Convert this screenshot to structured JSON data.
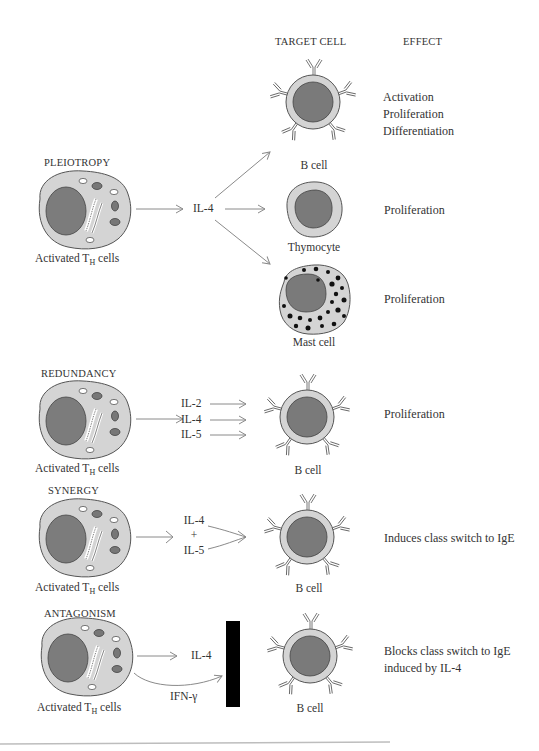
{
  "headers": {
    "target_cell": "TARGET CELL",
    "effect": "EFFECT"
  },
  "colors": {
    "cytoplasm": "#d2d2d2",
    "nucleus": "#7a7a7a",
    "outline": "#555555",
    "arrow": "#8a8a8a",
    "block_bar": "#000000"
  },
  "sections": {
    "pleiotropy": {
      "title": "PLEIOTROPY",
      "source_label": "Activated T",
      "source_sub": "H",
      "source_suffix": " cells",
      "cytokine": "IL-4",
      "targets": [
        {
          "cell": "B cell",
          "effect_lines": [
            "Activation",
            "Proliferation",
            "Differentiation"
          ]
        },
        {
          "cell": "Thymocyte",
          "effect_lines": [
            "Proliferation"
          ]
        },
        {
          "cell": "Mast cell",
          "effect_lines": [
            "Proliferation"
          ]
        }
      ]
    },
    "redundancy": {
      "title": "REDUNDANCY",
      "source_label": "Activated T",
      "source_sub": "H",
      "source_suffix": " cells",
      "cytokines": [
        "IL-2",
        "IL-4",
        "IL-5"
      ],
      "target_cell": "B cell",
      "effect": "Proliferation"
    },
    "synergy": {
      "title": "SYNERGY",
      "source_label": "Activated T",
      "source_sub": "H",
      "source_suffix": " cells",
      "cytokine_1": "IL-4",
      "plus": "+",
      "cytokine_2": "IL-5",
      "target_cell": "B cell",
      "effect": "Induces class switch to IgE"
    },
    "antagonism": {
      "title": "ANTAGONISM",
      "source_label": "Activated T",
      "source_sub": "H",
      "source_suffix": " cells",
      "cytokine_1": "IL-4",
      "cytokine_2": "IFN-γ",
      "target_cell": "B cell",
      "effect_lines": [
        "Blocks class switch to IgE",
        "induced by IL-4"
      ]
    }
  }
}
